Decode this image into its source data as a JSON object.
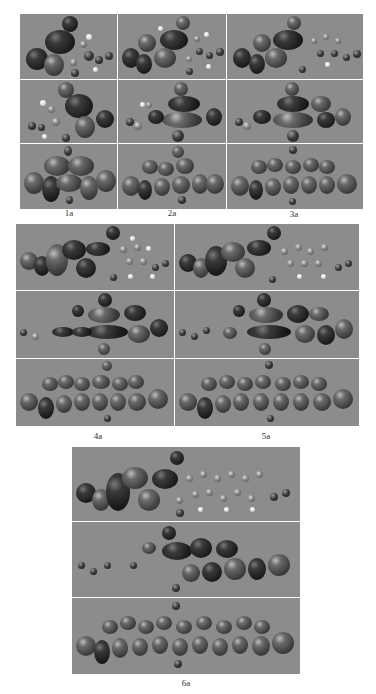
{
  "figure": {
    "panels": [
      {
        "id": "1a",
        "label": "1a",
        "rows": [
          "HOMO-like orbital, compact lobes on left ring",
          "LUMO-like orbital, central lobes",
          "delocalized orbital across molecule"
        ]
      },
      {
        "id": "2a",
        "label": "2a",
        "rows": [
          "orbital lobes on left rings",
          "central elongated lobes",
          "delocalized orbital"
        ]
      },
      {
        "id": "3a",
        "label": "3a",
        "rows": [
          "orbital lobes on left rings",
          "central elongated lobes",
          "delocalized orbital"
        ]
      },
      {
        "id": "4a",
        "label": "4a",
        "rows": [
          "orbital lobes on left rings",
          "central elongated lobes",
          "delocalized orbital"
        ]
      },
      {
        "id": "5a",
        "label": "5a",
        "rows": [
          "orbital lobes on left rings",
          "central elongated lobes",
          "delocalized orbital"
        ]
      },
      {
        "id": "6a",
        "label": "6a",
        "rows": [
          "orbital lobes on left rings",
          "central elongated lobes",
          "delocalized orbital"
        ]
      }
    ],
    "colors": {
      "panel_background": "#8c8c8c",
      "divider": "#e8e8e8",
      "lobe_dark": "#1c1c1c",
      "atom_hydrogen": "#e6e6e6",
      "page_background": "#ffffff"
    }
  }
}
